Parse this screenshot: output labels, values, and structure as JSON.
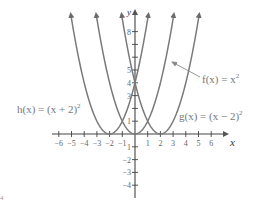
{
  "chart_data": {
    "type": "line",
    "title": "",
    "xlabel": "x",
    "ylabel": "y",
    "xlim": [
      -6.5,
      7
    ],
    "ylim": [
      -4.5,
      9.5
    ],
    "grid": false,
    "x_ticks": [
      -6,
      -5,
      -4,
      -3,
      -2,
      -1,
      1,
      2,
      3,
      4,
      5,
      6
    ],
    "y_ticks": [
      -4,
      -3,
      -2,
      -1,
      1,
      2,
      3,
      4,
      5,
      6,
      7,
      8
    ],
    "x_tick_labels": [
      "−6",
      "−5",
      "−4",
      "−3",
      "−2",
      "−1",
      "1",
      "2",
      "3",
      "4",
      "5",
      "6"
    ],
    "y_tick_labels_shown": {
      "8": "8",
      "5": "5",
      "4": "4",
      "3": "3",
      "1": "1",
      "-1": "1",
      "-2": "−2",
      "-3": "−3",
      "-4": "−4"
    },
    "series": [
      {
        "name": "h(x) = (x + 2)²",
        "vertex": [
          -2,
          0
        ],
        "formula": "(x+2)^2",
        "x_range": [
          -5.05,
          1.05
        ],
        "color": "#7a7a7a"
      },
      {
        "name": "f(x) = x²",
        "vertex": [
          0,
          0
        ],
        "formula": "x^2",
        "x_range": [
          -3.05,
          3.05
        ],
        "color": "#7a7a7a"
      },
      {
        "name": "g(x) = (x − 2)²",
        "vertex": [
          2,
          0
        ],
        "formula": "(x-2)^2",
        "x_range": [
          -1.05,
          5.05
        ],
        "color": "#7a7a7a"
      }
    ],
    "annotations": [
      {
        "text": "f(x) = x²",
        "points_to": [
          1.65,
          4.3
        ],
        "position": "right"
      },
      {
        "text": "g(x) = (x − 2)²",
        "position": "right of g curve near y=1"
      },
      {
        "text": "h(x) = (x + 2)²",
        "position": "left of h curve near y=1.5"
      }
    ]
  },
  "labels": {
    "axis_x": "x",
    "axis_y": "y",
    "f": {
      "name": "f(x) = x",
      "sup": "2"
    },
    "g": {
      "name": "g(x) = (x − 2)",
      "sup": "2"
    },
    "h": {
      "name": "h(x) = (x + 2)",
      "sup": "2"
    },
    "x_ticks": [
      "−6",
      "−5",
      "−4",
      "−3",
      "−2",
      "−1",
      "1",
      "2",
      "3",
      "4",
      "5",
      "6"
    ],
    "y_ticks_pos": [
      "8",
      "5",
      "4",
      "3",
      "1"
    ],
    "y_ticks_neg": [
      "1",
      "−2",
      "−3",
      "−4"
    ],
    "corner_mark": "4"
  }
}
